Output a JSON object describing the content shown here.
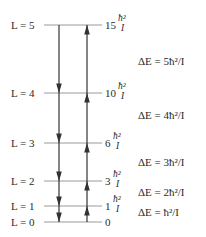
{
  "diagram": {
    "levels": [
      {
        "L": 5,
        "label": "L = 5",
        "energy_coef": "15",
        "y": 25
      },
      {
        "L": 4,
        "label": "L = 4",
        "energy_coef": "10",
        "y": 93
      },
      {
        "L": 3,
        "label": "L = 3",
        "energy_coef": "6",
        "y": 143
      },
      {
        "L": 2,
        "label": "L = 2",
        "energy_coef": "3",
        "y": 181
      },
      {
        "L": 1,
        "label": "L = 1",
        "energy_coef": "1",
        "y": 206
      },
      {
        "L": 0,
        "label": "L = 0",
        "energy_coef": "0",
        "y": 222
      }
    ],
    "energy_unit_num": "ħ²",
    "energy_unit_den": "I",
    "transitions": [
      {
        "label": "ΔE = 5ħ²/I",
        "y": 61
      },
      {
        "label": "ΔE = 4ħ²/I",
        "y": 115
      },
      {
        "label": "ΔE = 3ħ²/I",
        "y": 162
      },
      {
        "label": "ΔE = 2ħ²/I",
        "y": 192
      },
      {
        "label": "ΔE = ħ²/I",
        "y": 212
      }
    ],
    "arrows": {
      "emission_x": 59,
      "absorption_x": 87
    }
  }
}
